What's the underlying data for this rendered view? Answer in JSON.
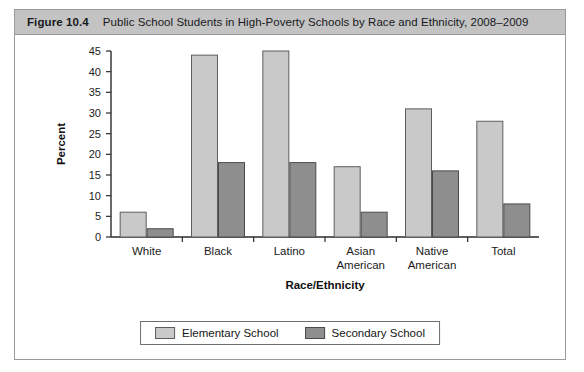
{
  "figure": {
    "number": "Figure 10.4",
    "title": "Public School Students in High-Poverty Schools by Race and Ethnicity, 2008–2009"
  },
  "chart_data": {
    "type": "bar",
    "title": "Public School Students in High-Poverty Schools by Race and Ethnicity, 2008–2009",
    "xlabel": "Race/Ethnicity",
    "ylabel": "Percent",
    "ylim": [
      0,
      45
    ],
    "yticks": [
      0,
      5,
      10,
      15,
      20,
      25,
      30,
      35,
      40,
      45
    ],
    "grid": false,
    "legend_position": "bottom-center",
    "categories": [
      "White",
      "Black",
      "Latino",
      "Asian American",
      "Native American",
      "Total"
    ],
    "category_lines": [
      [
        "White"
      ],
      [
        "Black"
      ],
      [
        "Latino"
      ],
      [
        "Asian",
        "American"
      ],
      [
        "Native",
        "American"
      ],
      [
        "Total"
      ]
    ],
    "series": [
      {
        "name": "Elementary School",
        "color": "#c9c9c9",
        "values": [
          6,
          44,
          45,
          17,
          31,
          28
        ]
      },
      {
        "name": "Secondary School",
        "color": "#8e8e8e",
        "values": [
          2,
          18,
          18,
          6,
          16,
          8
        ]
      }
    ]
  },
  "legend": {
    "items": [
      {
        "label": "Elementary School"
      },
      {
        "label": "Secondary School"
      }
    ]
  }
}
